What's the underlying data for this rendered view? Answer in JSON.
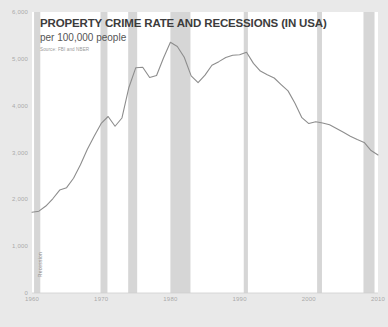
{
  "chart_data": {
    "type": "line",
    "title": "PROPERTY CRIME RATE AND RECESSIONS (IN USA)",
    "subtitle": "per 100,000 people",
    "source": "Source: FBI and NBER",
    "xlabel": "",
    "ylabel": "",
    "xlim": [
      1960,
      2010
    ],
    "ylim": [
      0,
      6000
    ],
    "grid": false,
    "legend_position": "none",
    "y_ticks": [
      "0",
      "1,000",
      "2,000",
      "3,000",
      "4,000",
      "5,000",
      "6,000"
    ],
    "y_tick_values": [
      0,
      1000,
      2000,
      3000,
      4000,
      5000,
      6000
    ],
    "x_ticks": [
      "1960",
      "1970",
      "1980",
      "1990",
      "2000",
      "2010"
    ],
    "x_tick_values": [
      1960,
      1970,
      1980,
      1990,
      2000,
      2010
    ],
    "line_color": "#8d8d8d",
    "band_color": "#d6d6d6",
    "plot_background": "#ffffff",
    "page_background": "#e9e9e9",
    "series": [
      {
        "name": "Property crime rate per 100,000 people",
        "x": [
          1960,
          1961,
          1962,
          1963,
          1964,
          1965,
          1966,
          1967,
          1968,
          1969,
          1970,
          1971,
          1972,
          1973,
          1974,
          1975,
          1976,
          1977,
          1978,
          1979,
          1980,
          1981,
          1982,
          1983,
          1984,
          1985,
          1986,
          1987,
          1988,
          1989,
          1990,
          1991,
          1992,
          1993,
          1994,
          1995,
          1996,
          1997,
          1998,
          1999,
          2000,
          2001,
          2002,
          2003,
          2004,
          2005,
          2006,
          2007,
          2008,
          2009,
          2010
        ],
        "values": [
          1726,
          1747,
          1857,
          2012,
          2198,
          2249,
          2451,
          2737,
          3071,
          3351,
          3621,
          3769,
          3561,
          3737,
          4389,
          4811,
          4820,
          4602,
          4643,
          5017,
          5353,
          5264,
          5033,
          4637,
          4492,
          4651,
          4863,
          4940,
          5027,
          5078,
          5088,
          5140,
          4903,
          4740,
          4660,
          4591,
          4451,
          4316,
          4053,
          3744,
          3618,
          3658,
          3631,
          3591,
          3514,
          3432,
          3347,
          3276,
          3215,
          3041,
          2946
        ]
      }
    ],
    "recession_bands": [
      {
        "label": "Recession",
        "start": 1960.3,
        "end": 1961.2
      },
      {
        "label": "Recession",
        "start": 1969.9,
        "end": 1970.9
      },
      {
        "label": "Recession",
        "start": 1973.9,
        "end": 1975.2
      },
      {
        "label": "Recession",
        "start": 1980.0,
        "end": 1982.9
      },
      {
        "label": "Recession",
        "start": 1990.6,
        "end": 1991.2
      },
      {
        "label": "Recession",
        "start": 2001.2,
        "end": 2001.9
      },
      {
        "label": "Recession",
        "start": 2007.9,
        "end": 2009.5
      }
    ],
    "annotations": [
      {
        "text": "Recession",
        "orientation": "vertical",
        "near_year": 1960
      }
    ]
  }
}
